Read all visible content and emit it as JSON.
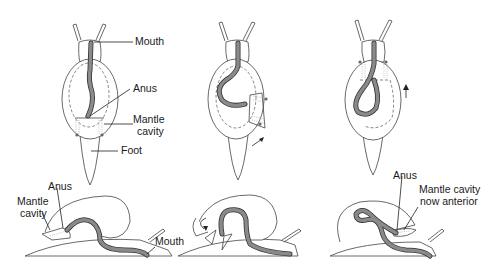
{
  "figure": {
    "colors": {
      "gut": "#8a8a8a",
      "gut_outline": "#333333",
      "outline": "#444444",
      "label": "#1a1a1a"
    },
    "panels": [
      {
        "id": "dorsal-1",
        "row": "top",
        "labels": [
          "Mouth",
          "Anus",
          "Mantle cavity",
          "Foot"
        ]
      },
      {
        "id": "dorsal-2",
        "row": "top",
        "labels": []
      },
      {
        "id": "dorsal-3",
        "row": "top",
        "labels": []
      },
      {
        "id": "lateral-1",
        "row": "bottom",
        "labels": [
          "Anus",
          "Mantle cavity",
          "Mouth"
        ]
      },
      {
        "id": "lateral-2",
        "row": "bottom",
        "labels": []
      },
      {
        "id": "lateral-3",
        "row": "bottom",
        "labels": [
          "Anus",
          "Mantle cavity now anterior"
        ]
      }
    ]
  },
  "labels": {
    "top_mouth": "Mouth",
    "top_anus": "Anus",
    "top_mantle_1": "Mantle",
    "top_mantle_2": "cavity",
    "top_foot": "Foot",
    "bl_anus": "Anus",
    "bl_mantle_1": "Mantle",
    "bl_mantle_2": "cavity",
    "bl_mouth": "Mouth",
    "br_anus": "Anus",
    "br_mantle_1": "Mantle cavity",
    "br_mantle_2": "now anterior"
  }
}
